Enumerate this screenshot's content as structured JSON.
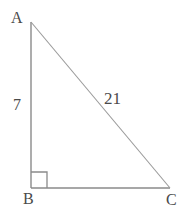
{
  "figure": {
    "type": "right-triangle-diagram",
    "canvas": {
      "width": 184,
      "height": 213
    },
    "background_color": "#ffffff",
    "stroke_color": "#8a8a8a",
    "hypotenuse_stroke_color": "#9a9a9a",
    "text_color": "#4a4a4a",
    "vertices": {
      "A": {
        "label": "A",
        "x": 31,
        "y": 22
      },
      "B": {
        "label": "B",
        "x": 31,
        "y": 188
      },
      "C": {
        "label": "C",
        "x": 170,
        "y": 188
      }
    },
    "right_angle": {
      "at_vertex": "B",
      "marker_size": 16,
      "marker_x": 31,
      "marker_y": 172
    },
    "sides": [
      {
        "name": "leg-ab",
        "from": "A",
        "to": "B",
        "measure_label": "7",
        "orientation": "vertical"
      },
      {
        "name": "leg-bc",
        "from": "B",
        "to": "C",
        "measure_label": "",
        "orientation": "horizontal"
      },
      {
        "name": "hypotenuse-ac",
        "from": "A",
        "to": "C",
        "measure_label": "21",
        "orientation": "diagonal"
      }
    ],
    "labels": {
      "vertex_a": "A",
      "vertex_b": "B",
      "vertex_c": "C",
      "leg_ab_length": "7",
      "hypotenuse_length": "21"
    }
  }
}
